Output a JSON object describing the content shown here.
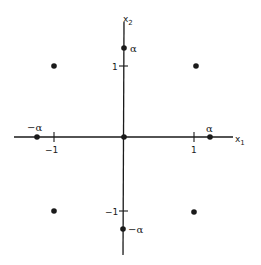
{
  "diagram": {
    "type": "central-composite-design",
    "axes": {
      "x_axis_label": "x",
      "x_axis_subscript": "1",
      "y_axis_label": "x",
      "y_axis_subscript": "2"
    },
    "ticks": {
      "x_pos": "1",
      "x_neg": "−1",
      "y_pos": "1",
      "y_neg": "−1"
    },
    "axial_labels": {
      "x_pos": "α",
      "x_neg": "−α",
      "y_pos": "α",
      "y_neg": "−α"
    },
    "points": [
      {
        "name": "corner-top-left",
        "x1": -1,
        "x2": 1
      },
      {
        "name": "corner-top-right",
        "x1": 1,
        "x2": 1
      },
      {
        "name": "corner-bottom-left",
        "x1": -1,
        "x2": -1
      },
      {
        "name": "corner-bottom-right",
        "x1": 1,
        "x2": -1
      },
      {
        "name": "center",
        "x1": 0,
        "x2": 0
      },
      {
        "name": "axial-x-pos",
        "x1": "alpha",
        "x2": 0
      },
      {
        "name": "axial-x-neg",
        "x1": "-alpha",
        "x2": 0
      },
      {
        "name": "axial-y-pos",
        "x1": 0,
        "x2": "alpha"
      },
      {
        "name": "axial-y-neg",
        "x1": 0,
        "x2": "-alpha"
      }
    ],
    "colors": {
      "ink": "#1a1a1a",
      "background": "#ffffff"
    }
  }
}
